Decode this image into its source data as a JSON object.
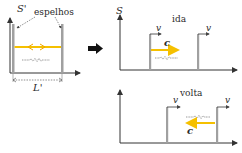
{
  "colors": {
    "axis": "#333333",
    "mirror": "#9a9a9a",
    "light": "#f5c000",
    "wave": "#555555",
    "arrow": "#111111",
    "text": "#2a2a2a"
  },
  "left_panel": {
    "frame_label": "S'",
    "mirrors_label": "espelhos",
    "length_label": "L'"
  },
  "transition_arrow": "right",
  "top_right_panel": {
    "frame_label": "S",
    "phase_label": "ida",
    "velocity_label_1": "v",
    "velocity_label_2": "v",
    "light_speed_label": "c",
    "light_direction": "right"
  },
  "bottom_right_panel": {
    "phase_label": "volta",
    "velocity_label_1": "v",
    "velocity_label_2": "v",
    "light_speed_label": "c",
    "light_direction": "left"
  }
}
